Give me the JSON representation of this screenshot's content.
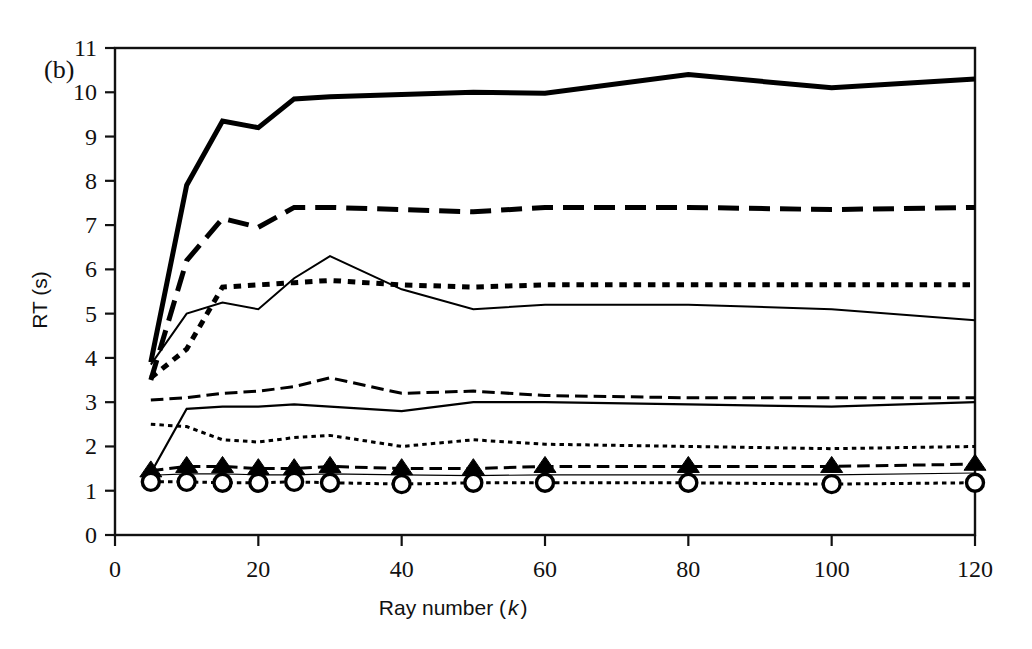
{
  "figure": {
    "panel_label": "(b)",
    "background_color": "#ffffff",
    "line_color": "#000000"
  },
  "chart_data": {
    "type": "line",
    "title": "",
    "subtitle": "",
    "xlabel": "Ray number (k)",
    "xlabel_main": "Ray number (",
    "xlabel_italic": "k",
    "xlabel_close": ")",
    "ylabel": "RT (s)",
    "xlim": [
      0,
      120
    ],
    "ylim": [
      0,
      11
    ],
    "xticks": [
      0,
      20,
      40,
      60,
      80,
      100,
      120
    ],
    "xtick_labels": [
      "0",
      "20",
      "40",
      "60",
      "80",
      "100",
      "120"
    ],
    "yticks": [
      0,
      1,
      2,
      3,
      4,
      5,
      6,
      7,
      8,
      9,
      10,
      11
    ],
    "ytick_labels": [
      "0",
      "1",
      "2",
      "3",
      "4",
      "5",
      "6",
      "7",
      "8",
      "9",
      "10",
      "11"
    ],
    "grid": false,
    "legend": "none",
    "x": [
      5,
      10,
      15,
      20,
      25,
      30,
      40,
      50,
      60,
      80,
      100,
      120
    ],
    "series": [
      {
        "name": "series-1-thick-solid",
        "style": "solid",
        "width": 5.0,
        "marker": "none",
        "values": [
          3.9,
          7.9,
          9.35,
          9.2,
          9.85,
          9.9,
          9.95,
          10.0,
          9.98,
          10.4,
          10.1,
          10.3
        ]
      },
      {
        "name": "series-2-thick-dashed",
        "style": "dashed",
        "width": 5.0,
        "marker": "none",
        "values": [
          3.5,
          6.2,
          7.15,
          6.95,
          7.4,
          7.4,
          7.35,
          7.3,
          7.4,
          7.4,
          7.35,
          7.4
        ]
      },
      {
        "name": "series-3-thin-solid",
        "style": "solid",
        "width": 2.0,
        "marker": "none",
        "values": [
          3.85,
          5.0,
          5.25,
          5.1,
          5.8,
          6.3,
          5.55,
          5.1,
          5.2,
          5.2,
          5.1,
          4.85
        ]
      },
      {
        "name": "series-4-thick-dotted",
        "style": "dotted",
        "width": 5.0,
        "marker": "none",
        "values": [
          3.55,
          4.2,
          5.6,
          5.65,
          5.7,
          5.75,
          5.65,
          5.6,
          5.65,
          5.65,
          5.65,
          5.65
        ]
      },
      {
        "name": "series-5-medium-dashed",
        "style": "dashed",
        "width": 3.0,
        "marker": "none",
        "values": [
          3.05,
          3.1,
          3.2,
          3.25,
          3.35,
          3.55,
          3.2,
          3.25,
          3.15,
          3.1,
          3.1,
          3.1
        ]
      },
      {
        "name": "series-6-thin-solid-low",
        "style": "solid",
        "width": 2.2,
        "marker": "none",
        "values": [
          1.4,
          2.85,
          2.9,
          2.9,
          2.95,
          2.9,
          2.8,
          3.0,
          3.0,
          2.95,
          2.9,
          3.0
        ]
      },
      {
        "name": "series-7-fine-dotted",
        "style": "dotted",
        "width": 3.0,
        "marker": "none",
        "values": [
          2.5,
          2.45,
          2.15,
          2.1,
          2.2,
          2.25,
          2.0,
          2.15,
          2.05,
          2.0,
          1.95,
          2.0
        ]
      },
      {
        "name": "series-8-dashed-triangle",
        "style": "dashed",
        "width": 3.0,
        "marker": "triangle",
        "values": [
          1.45,
          1.55,
          1.55,
          1.5,
          1.5,
          1.55,
          1.5,
          1.5,
          1.55,
          1.55,
          1.55,
          1.6
        ]
      },
      {
        "name": "series-9-thin-solid-triangle",
        "style": "solid",
        "width": 1.2,
        "marker": "none",
        "values": [
          1.35,
          1.38,
          1.38,
          1.36,
          1.36,
          1.38,
          1.36,
          1.34,
          1.36,
          1.36,
          1.36,
          1.4
        ]
      },
      {
        "name": "series-10-dotted-circle",
        "style": "dotted",
        "width": 3.0,
        "marker": "circle",
        "values": [
          1.2,
          1.2,
          1.18,
          1.18,
          1.2,
          1.18,
          1.15,
          1.18,
          1.18,
          1.18,
          1.15,
          1.18
        ]
      }
    ],
    "marker_x": [
      5,
      10,
      15,
      20,
      25,
      30,
      40,
      50,
      60,
      80,
      100,
      120
    ]
  }
}
